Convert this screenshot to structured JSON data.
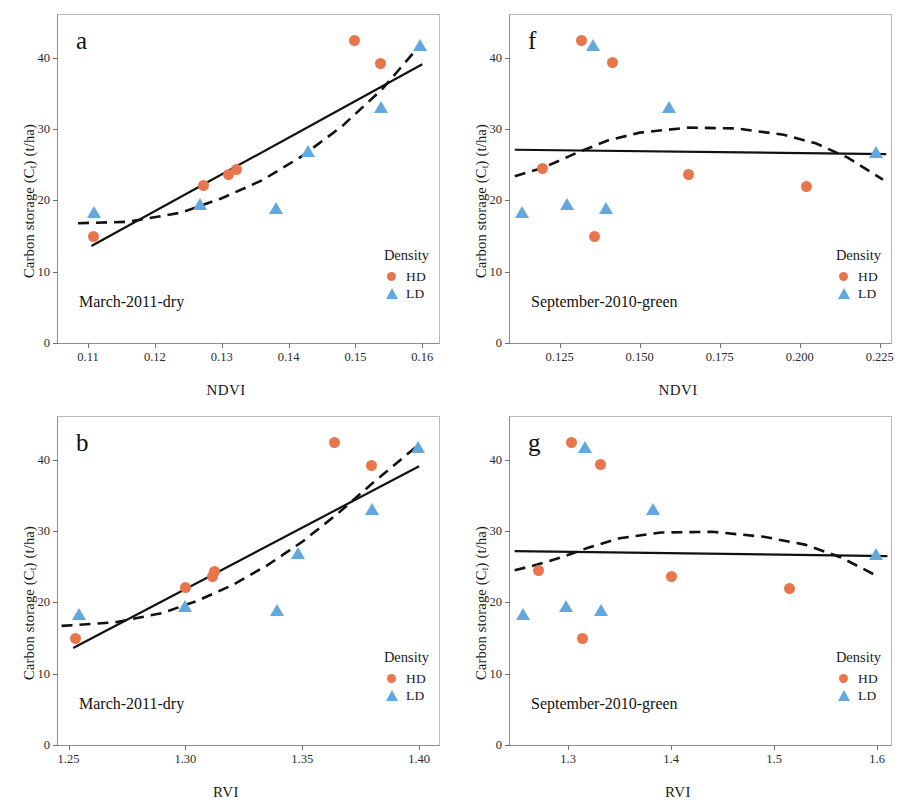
{
  "figure": {
    "marker_colors": {
      "HD": "#e8764c",
      "LD": "#62a8df"
    },
    "line_color": "#111111",
    "axis_color": "#6f6f6f"
  },
  "legend": {
    "title": "Density",
    "entries": [
      {
        "label": "HD",
        "marker": "circle",
        "color": "#e8764c"
      },
      {
        "label": "LD",
        "marker": "triangle",
        "color": "#62a8df"
      }
    ]
  },
  "common": {
    "ylabel_pre": "Carbon storage (C",
    "ylabel_sub": "t",
    "ylabel_post": ") (t/ha)",
    "yticks": [
      "0",
      "10",
      "20",
      "30",
      "40"
    ],
    "ylim": [
      0,
      46
    ]
  },
  "chart_data": [
    {
      "id": "a",
      "type": "scatter",
      "panel_letter": "a",
      "season": "March‑2011‑dry",
      "title": "",
      "xlabel": "NDVI",
      "ylabel": "Carbon storage (Ct) (t/ha)",
      "xlim": [
        0.1055,
        0.1625
      ],
      "ylim": [
        0,
        46
      ],
      "xticks": [
        0.11,
        0.12,
        0.13,
        0.14,
        0.15,
        0.16
      ],
      "xticklabels": [
        "0.11",
        "0.12",
        "0.13",
        "0.14",
        "0.15",
        "0.16"
      ],
      "yticks": [
        0,
        10,
        20,
        30,
        40
      ],
      "yticklabels": [
        "0",
        "10",
        "20",
        "30",
        "40"
      ],
      "grid": false,
      "legend_position": "bottom-right",
      "series": [
        {
          "name": "HD",
          "marker": "circle",
          "color": "#e8764c",
          "points": [
            {
              "x": 0.1108,
              "y": 14.9
            },
            {
              "x": 0.1272,
              "y": 22.1
            },
            {
              "x": 0.131,
              "y": 23.7
            },
            {
              "x": 0.1322,
              "y": 24.3
            },
            {
              "x": 0.1499,
              "y": 42.4
            },
            {
              "x": 0.1537,
              "y": 39.2
            }
          ]
        },
        {
          "name": "LD",
          "marker": "triangle",
          "color": "#62a8df",
          "points": [
            {
              "x": 0.1109,
              "y": 18.3
            },
            {
              "x": 0.1268,
              "y": 19.4
            },
            {
              "x": 0.1381,
              "y": 18.9
            },
            {
              "x": 0.1429,
              "y": 26.8
            },
            {
              "x": 0.1538,
              "y": 33.0
            },
            {
              "x": 0.1597,
              "y": 41.7
            }
          ]
        }
      ],
      "fits": [
        {
          "name": "linear",
          "style": "solid",
          "points": [
            {
              "x": 0.1105,
              "y": 13.6
            },
            {
              "x": 0.16,
              "y": 39.1
            }
          ]
        },
        {
          "name": "quadratic",
          "style": "dashed",
          "points": [
            {
              "x": 0.1085,
              "y": 16.8
            },
            {
              "x": 0.116,
              "y": 17.0
            },
            {
              "x": 0.124,
              "y": 18.3
            },
            {
              "x": 0.13,
              "y": 20.3
            },
            {
              "x": 0.136,
              "y": 22.8
            },
            {
              "x": 0.142,
              "y": 26.2
            },
            {
              "x": 0.148,
              "y": 30.4
            },
            {
              "x": 0.154,
              "y": 35.6
            },
            {
              "x": 0.1597,
              "y": 41.8
            }
          ]
        }
      ]
    },
    {
      "id": "f",
      "type": "scatter",
      "panel_letter": "f",
      "season": "September‑2010‑green",
      "title": "",
      "xlabel": "NDVI",
      "ylabel": "Carbon storage (Ct) (t/ha)",
      "xlim": [
        0.1095,
        0.2285
      ],
      "ylim": [
        0,
        46
      ],
      "xticks": [
        0.125,
        0.15,
        0.175,
        0.2,
        0.225
      ],
      "xticklabels": [
        "0.125",
        "0.150",
        "0.175",
        "0.200",
        "0.225"
      ],
      "yticks": [
        0,
        10,
        20,
        30,
        40
      ],
      "yticklabels": [
        "0",
        "10",
        "20",
        "30",
        "40"
      ],
      "grid": false,
      "legend_position": "bottom-right",
      "series": [
        {
          "name": "HD",
          "marker": "circle",
          "color": "#e8764c",
          "points": [
            {
              "x": 0.1197,
              "y": 24.5
            },
            {
              "x": 0.1318,
              "y": 42.4
            },
            {
              "x": 0.1359,
              "y": 14.9
            },
            {
              "x": 0.1415,
              "y": 39.3
            },
            {
              "x": 0.1651,
              "y": 23.7
            },
            {
              "x": 0.2022,
              "y": 22.0
            }
          ]
        },
        {
          "name": "LD",
          "marker": "triangle",
          "color": "#62a8df",
          "points": [
            {
              "x": 0.1134,
              "y": 18.3
            },
            {
              "x": 0.1273,
              "y": 19.4
            },
            {
              "x": 0.1355,
              "y": 41.7
            },
            {
              "x": 0.1394,
              "y": 18.9
            },
            {
              "x": 0.1592,
              "y": 33.0
            },
            {
              "x": 0.2238,
              "y": 26.7
            }
          ]
        }
      ],
      "fits": [
        {
          "name": "linear",
          "style": "solid",
          "points": [
            {
              "x": 0.111,
              "y": 27.1
            },
            {
              "x": 0.227,
              "y": 26.5
            }
          ]
        },
        {
          "name": "quadratic",
          "style": "dashed",
          "points": [
            {
              "x": 0.111,
              "y": 23.4
            },
            {
              "x": 0.12,
              "y": 24.6
            },
            {
              "x": 0.13,
              "y": 26.6
            },
            {
              "x": 0.14,
              "y": 28.4
            },
            {
              "x": 0.15,
              "y": 29.5
            },
            {
              "x": 0.165,
              "y": 30.2
            },
            {
              "x": 0.18,
              "y": 30.1
            },
            {
              "x": 0.195,
              "y": 29.2
            },
            {
              "x": 0.205,
              "y": 28.0
            },
            {
              "x": 0.215,
              "y": 26.0
            },
            {
              "x": 0.226,
              "y": 22.9
            }
          ]
        }
      ]
    },
    {
      "id": "b",
      "type": "scatter",
      "panel_letter": "b",
      "season": "March‑2011‑dry",
      "title": "",
      "xlabel": "RVI",
      "ylabel": "Carbon storage (Ct) (t/ha)",
      "xlim": [
        1.2455,
        1.4085
      ],
      "ylim": [
        0,
        46
      ],
      "xticks": [
        1.25,
        1.3,
        1.35,
        1.4
      ],
      "xticklabels": [
        "1.25",
        "1.30",
        "1.35",
        "1.40"
      ],
      "yticks": [
        0,
        10,
        20,
        30,
        40
      ],
      "yticklabels": [
        "0",
        "10",
        "20",
        "30",
        "40"
      ],
      "grid": false,
      "legend_position": "bottom-right",
      "series": [
        {
          "name": "HD",
          "marker": "circle",
          "color": "#e8764c",
          "points": [
            {
              "x": 1.2528,
              "y": 14.9
            },
            {
              "x": 1.3002,
              "y": 22.1
            },
            {
              "x": 1.3115,
              "y": 23.7
            },
            {
              "x": 1.3125,
              "y": 24.3
            },
            {
              "x": 1.364,
              "y": 42.4
            },
            {
              "x": 1.3797,
              "y": 39.2
            }
          ]
        },
        {
          "name": "LD",
          "marker": "triangle",
          "color": "#62a8df",
          "points": [
            {
              "x": 1.2545,
              "y": 18.3
            },
            {
              "x": 1.2998,
              "y": 19.4
            },
            {
              "x": 1.339,
              "y": 18.9
            },
            {
              "x": 1.3483,
              "y": 26.8
            },
            {
              "x": 1.38,
              "y": 33.0
            },
            {
              "x": 1.3995,
              "y": 41.7
            }
          ]
        }
      ],
      "fits": [
        {
          "name": "linear",
          "style": "solid",
          "points": [
            {
              "x": 1.252,
              "y": 13.6
            },
            {
              "x": 1.4,
              "y": 39.1
            }
          ]
        },
        {
          "name": "quadratic",
          "style": "dashed",
          "points": [
            {
              "x": 1.247,
              "y": 16.7
            },
            {
              "x": 1.27,
              "y": 17.2
            },
            {
              "x": 1.29,
              "y": 18.5
            },
            {
              "x": 1.305,
              "y": 20.2
            },
            {
              "x": 1.32,
              "y": 22.4
            },
            {
              "x": 1.335,
              "y": 25.2
            },
            {
              "x": 1.35,
              "y": 28.5
            },
            {
              "x": 1.365,
              "y": 32.4
            },
            {
              "x": 1.38,
              "y": 36.7
            },
            {
              "x": 1.399,
              "y": 41.9
            }
          ]
        }
      ]
    },
    {
      "id": "g",
      "type": "scatter",
      "panel_letter": "g",
      "season": "September‑2010‑green",
      "title": "",
      "xlabel": "RVI",
      "ylabel": "Carbon storage (Ct) (t/ha)",
      "xlim": [
        1.2435,
        1.6135
      ],
      "ylim": [
        0,
        46
      ],
      "xticks": [
        1.3,
        1.4,
        1.5,
        1.6
      ],
      "xticklabels": [
        "1.3",
        "1.4",
        "1.5",
        "1.6"
      ],
      "yticks": [
        0,
        10,
        20,
        30,
        40
      ],
      "yticklabels": [
        "0",
        "10",
        "20",
        "30",
        "40"
      ],
      "grid": false,
      "legend_position": "bottom-right",
      "series": [
        {
          "name": "HD",
          "marker": "circle",
          "color": "#e8764c",
          "points": [
            {
              "x": 1.271,
              "y": 24.5
            },
            {
              "x": 1.303,
              "y": 42.4
            },
            {
              "x": 1.314,
              "y": 14.9
            },
            {
              "x": 1.3315,
              "y": 39.3
            },
            {
              "x": 1.4,
              "y": 23.7
            },
            {
              "x": 1.515,
              "y": 22.0
            }
          ]
        },
        {
          "name": "LD",
          "marker": "triangle",
          "color": "#62a8df",
          "points": [
            {
              "x": 1.256,
              "y": 18.3
            },
            {
              "x": 1.2975,
              "y": 19.4
            },
            {
              "x": 1.3165,
              "y": 41.7
            },
            {
              "x": 1.3315,
              "y": 18.9
            },
            {
              "x": 1.382,
              "y": 33.0
            },
            {
              "x": 1.5985,
              "y": 26.7
            }
          ]
        }
      ],
      "fits": [
        {
          "name": "linear",
          "style": "solid",
          "points": [
            {
              "x": 1.248,
              "y": 27.2
            },
            {
              "x": 1.61,
              "y": 26.5
            }
          ]
        },
        {
          "name": "quadratic",
          "style": "dashed",
          "points": [
            {
              "x": 1.248,
              "y": 24.5
            },
            {
              "x": 1.27,
              "y": 25.3
            },
            {
              "x": 1.295,
              "y": 26.4
            },
            {
              "x": 1.32,
              "y": 27.7
            },
            {
              "x": 1.35,
              "y": 29.0
            },
            {
              "x": 1.39,
              "y": 29.8
            },
            {
              "x": 1.44,
              "y": 29.9
            },
            {
              "x": 1.49,
              "y": 29.2
            },
            {
              "x": 1.53,
              "y": 28.1
            },
            {
              "x": 1.565,
              "y": 26.3
            },
            {
              "x": 1.6,
              "y": 23.7
            }
          ]
        }
      ]
    }
  ]
}
